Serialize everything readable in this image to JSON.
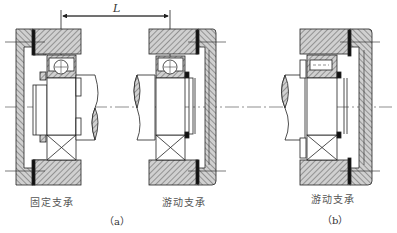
{
  "figure": {
    "dimension_label": "L",
    "assemblies": [
      {
        "id": "a-left",
        "caption": "固定支承",
        "bearing": "deep-groove-ball"
      },
      {
        "id": "a-right",
        "caption": "游动支承",
        "bearing": "deep-groove-ball"
      },
      {
        "id": "b",
        "caption": "游动支承",
        "bearing": "cylindrical-roller"
      }
    ],
    "subfigure_labels": [
      "（a）",
      "（b）"
    ]
  },
  "colors": {
    "line": "#222222",
    "hatch": "#555555",
    "section_fill": "#c8c8c8",
    "seal": "#111111",
    "text": "#555555"
  }
}
